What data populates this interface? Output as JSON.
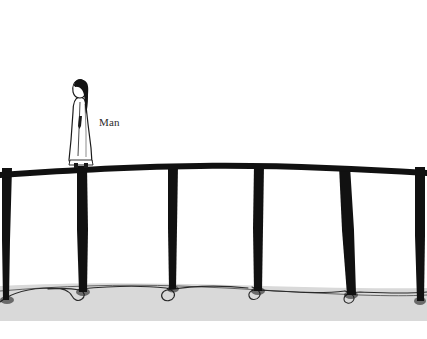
{
  "image": {
    "kind": "hand-drawn-sketch",
    "width": 427,
    "height": 339,
    "background_color": "#ffffff",
    "ink_color": "#111111",
    "ground_color": "#d9d9d9"
  },
  "annotations": {
    "man_label": "Man"
  },
  "subject": {
    "name": "standing-figure",
    "description": "robed figure with long dark hair standing on the rail",
    "robe_fill": "#ffffff",
    "hair_color": "#1a1a1a",
    "x": 83,
    "y": 120
  },
  "fence": {
    "rail": {
      "name": "horizontal-rail",
      "color": "#111111",
      "y_left": 170,
      "y_center": 163,
      "y_right": 170
    },
    "posts": [
      {
        "id": "post-1",
        "x": 5,
        "width": 9,
        "top": 168,
        "bottom": 300
      },
      {
        "id": "post-2",
        "x": 78,
        "width": 11,
        "top": 166,
        "bottom": 292
      },
      {
        "id": "post-3",
        "x": 170,
        "width": 10,
        "top": 164,
        "bottom": 288
      },
      {
        "id": "post-4",
        "x": 256,
        "width": 11,
        "top": 164,
        "bottom": 290
      },
      {
        "id": "post-5",
        "x": 341,
        "width": 11,
        "top": 166,
        "bottom": 294
      },
      {
        "id": "post-6",
        "x": 417,
        "width": 9,
        "top": 168,
        "bottom": 300
      }
    ]
  },
  "ground": {
    "name": "ground-band",
    "color": "#d9d9d9",
    "top": 283,
    "bottom": 321,
    "squiggle_color": "#2a2a2a"
  }
}
